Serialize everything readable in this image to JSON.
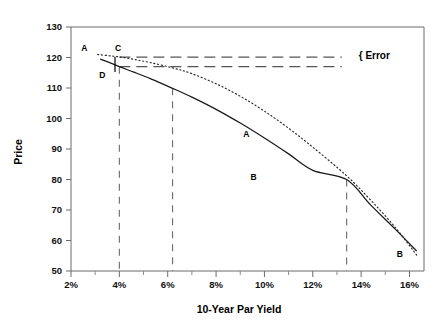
{
  "chart_data": {
    "type": "line",
    "title": "",
    "xlabel": "10-Year Par Yield",
    "ylabel": "Price",
    "xlim": [
      2,
      16.6
    ],
    "ylim": [
      50,
      130
    ],
    "grid": false,
    "legend_position": "inline-annotations",
    "x_ticks": [
      "2%",
      "4%",
      "6%",
      "8%",
      "10%",
      "12%",
      "14%",
      "16%"
    ],
    "x_tick_values": [
      2,
      4,
      6,
      8,
      10,
      12,
      14,
      16
    ],
    "x_minor_tick_values": [
      3,
      5,
      7,
      9,
      11,
      13,
      15
    ],
    "y_ticks": [
      "50",
      "60",
      "70",
      "80",
      "90",
      "100",
      "110",
      "120",
      "130"
    ],
    "y_tick_values": [
      50,
      60,
      70,
      80,
      90,
      100,
      110,
      120,
      130
    ],
    "series": [
      {
        "name": "A",
        "style": "dotted",
        "color": "#2a2a2a",
        "x": [
          3.1,
          3.55,
          4.0,
          4.6,
          5.3,
          6.2,
          7.0,
          8.0,
          9.0,
          10.0,
          11.0,
          12.0,
          13.4,
          14.4,
          15.4,
          16.3
        ],
        "y": [
          121.0,
          120.6,
          120.2,
          119.4,
          118.3,
          116.6,
          114.7,
          111.4,
          107.3,
          102.4,
          96.8,
          90.6,
          81.2,
          73.2,
          64.4,
          55.2
        ]
      },
      {
        "name": "B",
        "style": "solid",
        "color": "#1a1a1a",
        "x": [
          3.2,
          3.6,
          4.0,
          4.6,
          5.3,
          6.2,
          7.0,
          8.0,
          9.0,
          10.0,
          11.0,
          12.0,
          13.4,
          14.4,
          15.4,
          16.3
        ],
        "y": [
          119.5,
          118.3,
          117.0,
          115.2,
          113.0,
          109.9,
          107.0,
          103.0,
          98.5,
          93.6,
          88.4,
          83.0,
          80.0,
          71.6,
          63.8,
          56.5
        ]
      }
    ],
    "reference_lines": {
      "vertical": [
        {
          "name": "yield-4-percent",
          "x": 4.0,
          "y_top": 117.0,
          "y_bottom": 50
        },
        {
          "name": "yield-6-2-percent",
          "x": 6.2,
          "y_top": 109.9,
          "y_bottom": 50
        },
        {
          "name": "yield-13-4-percent",
          "x": 13.4,
          "y_top": 80.0,
          "y_bottom": 50
        }
      ],
      "horizontal": [
        {
          "name": "error-upper",
          "y": 120.1,
          "x_start": 4.0,
          "x_end": 13.2
        },
        {
          "name": "error-lower",
          "y": 117.0,
          "x_start": 4.0,
          "x_end": 13.2
        }
      ]
    },
    "annotations": [
      {
        "label": "A",
        "x": 2.55,
        "y": 122.2,
        "name": "point-label-a-top"
      },
      {
        "label": "C",
        "x": 3.95,
        "y": 122.2,
        "name": "point-label-c"
      },
      {
        "label": "D",
        "x": 3.3,
        "y": 113.2,
        "name": "point-label-d"
      },
      {
        "label": "A",
        "x": 9.25,
        "y": 94.0,
        "name": "point-label-a-mid"
      },
      {
        "label": "B",
        "x": 9.55,
        "y": 80.0,
        "name": "point-label-b-mid"
      },
      {
        "label": "B",
        "x": 15.6,
        "y": 54.6,
        "name": "point-label-b-end"
      },
      {
        "label": "{ Error",
        "x": 13.9,
        "y": 119.6,
        "name": "error-bracket-label"
      }
    ]
  },
  "labels": {
    "error_bracket": "{ Error",
    "y_axis_title": "Price",
    "x_axis_title": "10-Year Par Yield"
  },
  "colors": {
    "solid_curve": "#1a1a1a",
    "dotted_curve": "#2a2a2a",
    "axis": "#6b6b6b",
    "dash_reference": "#6f6f6f",
    "background": "#ffffff"
  }
}
